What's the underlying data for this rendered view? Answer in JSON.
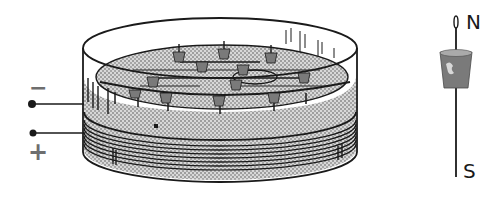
{
  "figure": {
    "terminals": {
      "negative_label": "−",
      "positive_label": "+"
    },
    "compass": {
      "north_label": "N",
      "south_label": "S"
    },
    "colors": {
      "ink": "#1a1a1a",
      "stipple": "#8c8c8c",
      "label_gray": "#6e6e6e",
      "cork": "#7a7a7a",
      "background": "#ffffff"
    }
  }
}
